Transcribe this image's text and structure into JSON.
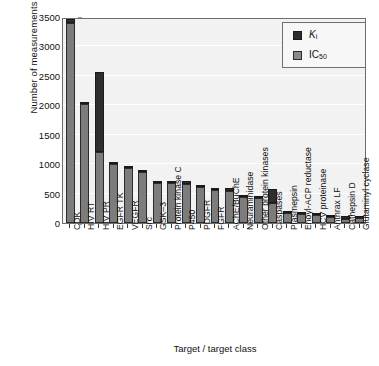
{
  "chart_data": {
    "type": "bar",
    "subtype": "stacked-vertical-bar",
    "title": "",
    "xlabel": "Target / target class",
    "ylabel": "Number of measurements",
    "ylim": [
      0,
      3500
    ],
    "yticks": [
      0,
      500,
      1000,
      1500,
      2000,
      2500,
      3000,
      3500
    ],
    "ytick_labels": [
      "0",
      "500",
      "1000",
      "1500",
      "2000",
      "2500",
      "3000",
      "3500"
    ],
    "grid": "horizontal",
    "legend_position": "top-right",
    "categories": [
      "CDK",
      "HIV RT",
      "HIV PR",
      "EGFR TK",
      "VEGFR",
      "Src",
      "GSK–3",
      "Protein kinase C",
      "P450",
      "PDGFR",
      "FGFR",
      "AChE/BuChE",
      "Neuraminidase",
      "Other protein kinases",
      "Caspases",
      "Plasmepsin",
      "Enoyl-ACP reductase",
      "HCV proteinase",
      "Anthrax LF",
      "Cathepsin D",
      "Glutaminyl cyclase"
    ],
    "series": [
      {
        "name": "IC50",
        "label_html": "IC<sub>50</sub>",
        "color": "#7c7c7c",
        "values": [
          3400,
          2030,
          1200,
          1000,
          930,
          860,
          680,
          680,
          670,
          615,
          555,
          540,
          450,
          430,
          340,
          175,
          160,
          135,
          105,
          75,
          90
        ]
      },
      {
        "name": "Ki",
        "label_html": "<i>K</i><sub>i</sub>",
        "color": "#2e2e2e",
        "values": [
          70,
          25,
          1370,
          35,
          30,
          25,
          20,
          15,
          50,
          15,
          20,
          60,
          15,
          10,
          240,
          25,
          20,
          25,
          35,
          45,
          15
        ]
      }
    ],
    "totals": [
      3470,
      2055,
      2570,
      1035,
      960,
      885,
      700,
      695,
      720,
      630,
      575,
      600,
      465,
      440,
      580,
      200,
      180,
      160,
      140,
      120,
      105
    ]
  },
  "legend": {
    "entries": [
      {
        "key": "ki",
        "text": "Ki"
      },
      {
        "key": "ic50",
        "text": "IC50"
      }
    ]
  }
}
